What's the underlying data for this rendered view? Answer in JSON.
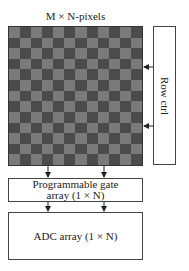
{
  "diagram": {
    "title": "M × N-pixels",
    "pixel_array": {
      "columns": 12,
      "rows": 13,
      "light_color": "#7a7a7a",
      "dark_color": "#4b4b4b"
    },
    "row_ctrl": {
      "label": "Row ctrl"
    },
    "gate_array": {
      "line1": "Programmable gate",
      "line2": "array (1 × N)"
    },
    "adc_array": {
      "label": "ADC array (1 × N)"
    },
    "arrows": [
      {
        "from": "row_ctrl",
        "to": "pixel_array",
        "y": 67
      },
      {
        "from": "row_ctrl",
        "to": "pixel_array",
        "y": 126
      },
      {
        "from": "pixel_array",
        "to": "gate_array",
        "x": 48
      },
      {
        "from": "pixel_array",
        "to": "gate_array",
        "x": 104
      },
      {
        "from": "gate_array",
        "to": "adc_array",
        "x": 48
      },
      {
        "from": "gate_array",
        "to": "adc_array",
        "x": 104
      }
    ]
  }
}
